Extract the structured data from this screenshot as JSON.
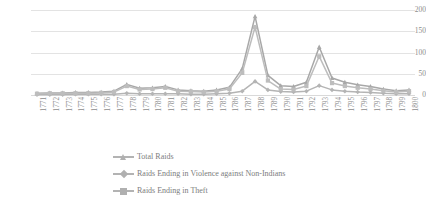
{
  "chart_data": {
    "type": "line",
    "title": "",
    "xlabel": "",
    "ylabel": "",
    "ylim": [
      0,
      200
    ],
    "yticks": [
      0,
      50,
      100,
      150,
      200
    ],
    "grid": true,
    "legend_position": "bottom",
    "categories": [
      "1771",
      "1772",
      "1773",
      "1774",
      "1775",
      "1776",
      "1777",
      "1778",
      "1779",
      "1780",
      "1781",
      "1782",
      "1783",
      "1784",
      "1785",
      "1786",
      "1787",
      "1788",
      "1789",
      "1790",
      "1791",
      "1792",
      "1793",
      "1794",
      "1795",
      "1796",
      "1797",
      "1798",
      "1799",
      "1800"
    ],
    "series": [
      {
        "name": "Total Raids",
        "marker": "triangle",
        "color": "#a8a8a8",
        "values": [
          4,
          5,
          5,
          6,
          6,
          7,
          9,
          25,
          16,
          17,
          20,
          12,
          10,
          9,
          12,
          18,
          62,
          185,
          46,
          22,
          20,
          30,
          113,
          40,
          30,
          24,
          20,
          14,
          10,
          12
        ]
      },
      {
        "name": "Raids Ending in Violence against Non-Indians",
        "marker": "diamond",
        "color": "#b4b4b4",
        "values": [
          1,
          1,
          1,
          2,
          2,
          2,
          2,
          4,
          3,
          3,
          3,
          3,
          2,
          2,
          3,
          4,
          9,
          32,
          12,
          8,
          7,
          9,
          22,
          12,
          9,
          7,
          6,
          4,
          3,
          3
        ]
      },
      {
        "name": "Raids Ending in Theft",
        "marker": "square",
        "color": "#bdbdbd",
        "values": [
          3,
          4,
          4,
          4,
          4,
          5,
          7,
          21,
          13,
          14,
          17,
          9,
          8,
          7,
          9,
          14,
          52,
          160,
          34,
          14,
          13,
          21,
          91,
          28,
          21,
          17,
          14,
          10,
          7,
          9
        ]
      }
    ]
  },
  "axis": {
    "y_tick_labels": [
      "200",
      "150",
      "100",
      "50",
      "0"
    ]
  },
  "legend": {
    "items": [
      {
        "label": "Total Raids",
        "marker": "triangle"
      },
      {
        "label": "Raids Ending in Violence against Non-Indians",
        "marker": "diamond"
      },
      {
        "label": "Raids Ending in Theft",
        "marker": "square"
      }
    ]
  },
  "colors": {
    "series_total": "#a8a8a8",
    "series_violence": "#b4b4b4",
    "series_theft": "#bdbdbd",
    "gridline": "#e3e3e3",
    "text": "#8d8d8d",
    "background": "#ffffff"
  }
}
